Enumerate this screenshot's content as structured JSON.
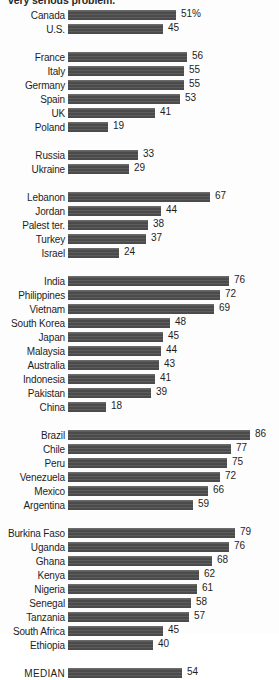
{
  "headline": "very serious problem.",
  "units": "percent",
  "note": "Canada value carries the percent sign as the first data label.",
  "colors": {
    "bar": "#4b4b4b",
    "text": "#1d1d1d",
    "background": "#fdfdfd"
  },
  "chart_data": {
    "type": "bar",
    "orientation": "horizontal",
    "title": "very serious problem.",
    "xlabel": "",
    "ylabel": "",
    "xlim": [
      0,
      86
    ],
    "grid": false,
    "legend": null,
    "value_suffix_first_row": "%",
    "categories": [
      "Canada",
      "U.S.",
      "France",
      "Italy",
      "Germany",
      "Spain",
      "UK",
      "Poland",
      "Russia",
      "Ukraine",
      "Lebanon",
      "Jordan",
      "Palest ter.",
      "Turkey",
      "Israel",
      "India",
      "Philippines",
      "Vietnam",
      "South Korea",
      "Japan",
      "Malaysia",
      "Australia",
      "Indonesia",
      "Pakistan",
      "China",
      "Brazil",
      "Chile",
      "Peru",
      "Venezuela",
      "Mexico",
      "Argentina",
      "Burkina Faso",
      "Uganda",
      "Ghana",
      "Kenya",
      "Nigeria",
      "Senegal",
      "Tanzania",
      "South Africa",
      "Ethiopia",
      "MEDIAN"
    ],
    "values": [
      51,
      45,
      56,
      55,
      55,
      53,
      41,
      19,
      33,
      29,
      67,
      44,
      38,
      37,
      24,
      76,
      72,
      69,
      48,
      45,
      44,
      43,
      41,
      39,
      18,
      86,
      77,
      75,
      72,
      66,
      59,
      79,
      76,
      68,
      62,
      61,
      58,
      57,
      45,
      40,
      54
    ],
    "groups": [
      {
        "name": "North America",
        "rows": [
          {
            "label": "Canada",
            "value": 51,
            "display": "51%"
          },
          {
            "label": "U.S.",
            "value": 45,
            "display": "45"
          }
        ]
      },
      {
        "name": "Europe",
        "rows": [
          {
            "label": "France",
            "value": 56,
            "display": "56"
          },
          {
            "label": "Italy",
            "value": 55,
            "display": "55"
          },
          {
            "label": "Germany",
            "value": 55,
            "display": "55"
          },
          {
            "label": "Spain",
            "value": 53,
            "display": "53"
          },
          {
            "label": "UK",
            "value": 41,
            "display": "41"
          },
          {
            "label": "Poland",
            "value": 19,
            "display": "19"
          }
        ]
      },
      {
        "name": "Eastern Europe",
        "rows": [
          {
            "label": "Russia",
            "value": 33,
            "display": "33"
          },
          {
            "label": "Ukraine",
            "value": 29,
            "display": "29"
          }
        ]
      },
      {
        "name": "Middle East",
        "rows": [
          {
            "label": "Lebanon",
            "value": 67,
            "display": "67"
          },
          {
            "label": "Jordan",
            "value": 44,
            "display": "44"
          },
          {
            "label": "Palest ter.",
            "value": 38,
            "display": "38"
          },
          {
            "label": "Turkey",
            "value": 37,
            "display": "37"
          },
          {
            "label": "Israel",
            "value": 24,
            "display": "24"
          }
        ]
      },
      {
        "name": "Asia/Pacific",
        "rows": [
          {
            "label": "India",
            "value": 76,
            "display": "76"
          },
          {
            "label": "Philippines",
            "value": 72,
            "display": "72"
          },
          {
            "label": "Vietnam",
            "value": 69,
            "display": "69"
          },
          {
            "label": "South Korea",
            "value": 48,
            "display": "48"
          },
          {
            "label": "Japan",
            "value": 45,
            "display": "45"
          },
          {
            "label": "Malaysia",
            "value": 44,
            "display": "44"
          },
          {
            "label": "Australia",
            "value": 43,
            "display": "43"
          },
          {
            "label": "Indonesia",
            "value": 41,
            "display": "41"
          },
          {
            "label": "Pakistan",
            "value": 39,
            "display": "39"
          },
          {
            "label": "China",
            "value": 18,
            "display": "18"
          }
        ]
      },
      {
        "name": "Latin America",
        "rows": [
          {
            "label": "Brazil",
            "value": 86,
            "display": "86"
          },
          {
            "label": "Chile",
            "value": 77,
            "display": "77"
          },
          {
            "label": "Peru",
            "value": 75,
            "display": "75"
          },
          {
            "label": "Venezuela",
            "value": 72,
            "display": "72"
          },
          {
            "label": "Mexico",
            "value": 66,
            "display": "66"
          },
          {
            "label": "Argentina",
            "value": 59,
            "display": "59"
          }
        ]
      },
      {
        "name": "Africa",
        "rows": [
          {
            "label": "Burkina Faso",
            "value": 79,
            "display": "79"
          },
          {
            "label": "Uganda",
            "value": 76,
            "display": "76"
          },
          {
            "label": "Ghana",
            "value": 68,
            "display": "68"
          },
          {
            "label": "Kenya",
            "value": 62,
            "display": "62"
          },
          {
            "label": "Nigeria",
            "value": 61,
            "display": "61"
          },
          {
            "label": "Senegal",
            "value": 58,
            "display": "58"
          },
          {
            "label": "Tanzania",
            "value": 57,
            "display": "57"
          },
          {
            "label": "South Africa",
            "value": 45,
            "display": "45"
          },
          {
            "label": "Ethiopia",
            "value": 40,
            "display": "40"
          }
        ]
      },
      {
        "name": "Summary",
        "rows": [
          {
            "label": "MEDIAN",
            "value": 54,
            "display": "54"
          }
        ]
      }
    ]
  }
}
